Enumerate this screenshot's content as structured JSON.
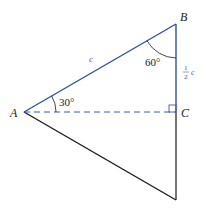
{
  "diagram": {
    "colors": {
      "blue_edge": "#2f4fa0",
      "black_edge": "#1a1a1a",
      "dashed": "#3b5aa8",
      "label": "#222222",
      "blue_label": "#3b5aa8"
    },
    "vertices": [
      {
        "id": "A",
        "label": "A",
        "x": 24,
        "y": 112
      },
      {
        "id": "B",
        "label": "B",
        "x": 176,
        "y": 24
      },
      {
        "id": "C",
        "label": "C",
        "x": 176,
        "y": 112
      },
      {
        "id": "D",
        "label": "",
        "x": 176,
        "y": 200
      }
    ],
    "edges": [
      {
        "from": "A",
        "to": "B",
        "style": "solid",
        "color": "blue",
        "label": "c"
      },
      {
        "from": "B",
        "to": "C",
        "style": "solid",
        "color": "blue",
        "label": "1/2 c"
      },
      {
        "from": "A",
        "to": "C",
        "style": "dashed",
        "color": "blue",
        "label": ""
      },
      {
        "from": "C",
        "to": "D",
        "style": "solid",
        "color": "black",
        "label": ""
      },
      {
        "from": "A",
        "to": "D",
        "style": "solid",
        "color": "black",
        "label": ""
      }
    ],
    "labels": {
      "A": "A",
      "B": "B",
      "C": "C",
      "hypotenuse": "c",
      "half_numerator": "1",
      "half_denominator": "2",
      "half_var": "c",
      "angle_A": "30°",
      "angle_B": "60°"
    },
    "angles": [
      {
        "vertex": "A",
        "value": "30°"
      },
      {
        "vertex": "B",
        "value": "60°"
      },
      {
        "vertex": "C",
        "value": "90°",
        "marker": "right-angle-square"
      }
    ]
  }
}
